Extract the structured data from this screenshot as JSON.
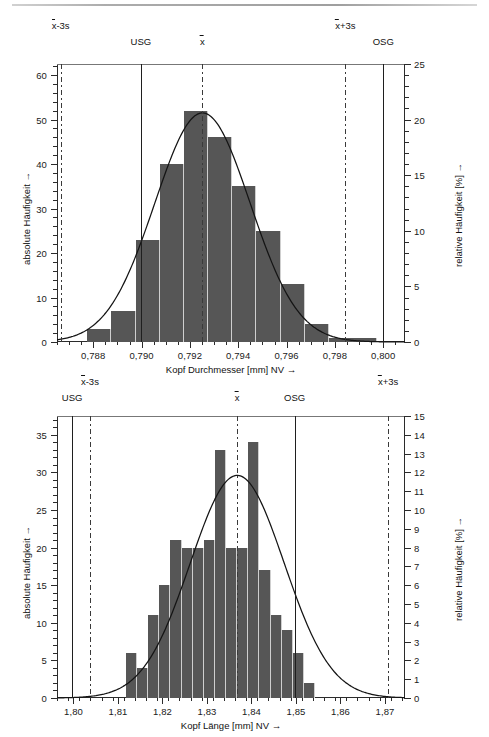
{
  "figures": [
    {
      "id": "kopf-durchmesser",
      "y_left_title": "absolute Häufigkeit →",
      "y_right_title": "relative Häufigkeit [%] →",
      "x_title": "Kopf Durchmesser [mm]  NV →",
      "markers": [
        {
          "name": "xbar-minus-3s",
          "label_pre": "x",
          "label_post": "-3s",
          "value": 0.78665,
          "style": "dashdot",
          "row": 0
        },
        {
          "name": "usg",
          "label_pre": "",
          "label_post": "USG",
          "value": 0.78997,
          "style": "solid",
          "row": 1
        },
        {
          "name": "xbar",
          "label_pre": "x",
          "label_post": "",
          "value": 0.79252,
          "style": "dashdot",
          "row": 1
        },
        {
          "name": "xbar-plus-3s",
          "label_pre": "x",
          "label_post": "+3s",
          "value": 0.79843,
          "style": "dashdot",
          "row": 0
        },
        {
          "name": "osg",
          "label_pre": "",
          "label_post": "OSG",
          "value": 0.8,
          "style": "solid",
          "row": 1
        }
      ],
      "chart_data": {
        "type": "bar",
        "title": "",
        "xlabel": "Kopf Durchmesser [mm]  NV →",
        "ylabel": "absolute Häufigkeit →",
        "y2label": "relative Häufigkeit [%] →",
        "xlim": [
          0.7865,
          0.8009
        ],
        "ylim": [
          0,
          62.5
        ],
        "y2lim": [
          0,
          25
        ],
        "grid": false,
        "legend": "none",
        "xticks": [
          "0,788",
          "0,790",
          "0,792",
          "0,794",
          "0,796",
          "0,798",
          "0,800"
        ],
        "xtick_values": [
          0.788,
          0.79,
          0.792,
          0.794,
          0.796,
          0.798,
          0.8
        ],
        "xtick_minor_step": 0.0005,
        "yticks": [
          0,
          10,
          20,
          30,
          40,
          50,
          60
        ],
        "ytick_minor_step": 2,
        "y2ticks": [
          0,
          5,
          10,
          15,
          20,
          25
        ],
        "y2tick_minor_step": 1,
        "bin_width": 0.0005,
        "bin_starts": [
          0.78725,
          0.78775,
          0.78825,
          0.78875,
          0.78925,
          0.78975,
          0.79025,
          0.79075,
          0.79125,
          0.79175,
          0.79225,
          0.79275,
          0.79325,
          0.79375,
          0.79425,
          0.79475,
          0.79525,
          0.79575,
          0.79625,
          0.79675,
          0.79725,
          0.79775,
          0.79825,
          0.79875,
          0.79925
        ],
        "values": [
          0,
          3,
          3,
          7,
          7,
          23,
          23,
          40,
          40,
          52,
          52,
          46,
          46,
          35,
          35,
          25,
          25,
          13,
          13,
          4,
          4,
          1,
          1,
          1,
          1
        ],
        "bars": [
          {
            "start": 0.78775,
            "end": 0.78875,
            "count": 3
          },
          {
            "start": 0.78875,
            "end": 0.78975,
            "count": 7
          },
          {
            "start": 0.78975,
            "end": 0.79075,
            "count": 23
          },
          {
            "start": 0.79075,
            "end": 0.79175,
            "count": 40
          },
          {
            "start": 0.79175,
            "end": 0.79275,
            "count": 52
          },
          {
            "start": 0.79275,
            "end": 0.79375,
            "count": 46
          },
          {
            "start": 0.79375,
            "end": 0.79475,
            "count": 35
          },
          {
            "start": 0.79475,
            "end": 0.79575,
            "count": 25
          },
          {
            "start": 0.79575,
            "end": 0.79675,
            "count": 13
          },
          {
            "start": 0.79675,
            "end": 0.79775,
            "count": 4
          },
          {
            "start": 0.79775,
            "end": 0.79975,
            "count": 1
          }
        ],
        "normal_curve": {
          "mean": 0.79252,
          "sigma": 0.001972,
          "peak": 51.5
        }
      }
    },
    {
      "id": "kopf-laenge",
      "y_left_title": "absolute Häufigkeit →",
      "y_right_title": "relative Häufigkeit [%] →",
      "x_title": "Kopf Länge [mm]  NV →",
      "markers": [
        {
          "name": "usg",
          "label_pre": "",
          "label_post": "USG",
          "value": 1.7997,
          "style": "solid",
          "row": 1
        },
        {
          "name": "xbar-minus-3s",
          "label_pre": "x",
          "label_post": "-3s",
          "value": 1.8037,
          "style": "dashdot",
          "row": 0
        },
        {
          "name": "xbar",
          "label_pre": "x",
          "label_post": "",
          "value": 1.8368,
          "style": "dashdot",
          "row": 1
        },
        {
          "name": "osg",
          "label_pre": "",
          "label_post": "OSG",
          "value": 1.8497,
          "style": "solid",
          "row": 1
        },
        {
          "name": "xbar-plus-3s",
          "label_pre": "x",
          "label_post": "+3s",
          "value": 1.8707,
          "style": "dashdot",
          "row": 0
        }
      ],
      "chart_data": {
        "type": "bar",
        "title": "",
        "xlabel": "Kopf Länge [mm]  NV →",
        "ylabel": "absolute Häufigkeit →",
        "y2label": "relative Häufigkeit [%] →",
        "xlim": [
          1.7963,
          1.8745
        ],
        "ylim": [
          0,
          37.5
        ],
        "y2lim": [
          0,
          15
        ],
        "grid": false,
        "legend": "none",
        "xticks": [
          "1,80",
          "1,81",
          "1,82",
          "1,83",
          "1,84",
          "1,85",
          "1,86",
          "1,87"
        ],
        "xtick_values": [
          1.8,
          1.81,
          1.82,
          1.83,
          1.84,
          1.85,
          1.86,
          1.87
        ],
        "xtick_minor_step": 0.0025,
        "yticks": [
          0,
          5,
          10,
          15,
          20,
          25,
          30,
          35
        ],
        "ytick_minor_step": 1,
        "y2ticks": [
          0,
          1,
          2,
          3,
          4,
          5,
          6,
          7,
          8,
          9,
          10,
          11,
          12,
          13,
          14,
          15
        ],
        "y2tick_minor_step": 1,
        "bin_width": 0.0025,
        "bars": [
          {
            "start": 1.8118,
            "end": 1.8143,
            "count": 6
          },
          {
            "start": 1.8143,
            "end": 1.8168,
            "count": 4
          },
          {
            "start": 1.8168,
            "end": 1.8193,
            "count": 11
          },
          {
            "start": 1.8193,
            "end": 1.8218,
            "count": 15
          },
          {
            "start": 1.8218,
            "end": 1.8243,
            "count": 21
          },
          {
            "start": 1.8243,
            "end": 1.8268,
            "count": 20
          },
          {
            "start": 1.8268,
            "end": 1.8293,
            "count": 20
          },
          {
            "start": 1.8293,
            "end": 1.8318,
            "count": 21
          },
          {
            "start": 1.8318,
            "end": 1.8343,
            "count": 33
          },
          {
            "start": 1.8343,
            "end": 1.8368,
            "count": 20
          },
          {
            "start": 1.8368,
            "end": 1.8393,
            "count": 20
          },
          {
            "start": 1.8393,
            "end": 1.8418,
            "count": 34
          },
          {
            "start": 1.8418,
            "end": 1.8443,
            "count": 17
          },
          {
            "start": 1.8443,
            "end": 1.8468,
            "count": 11
          },
          {
            "start": 1.8468,
            "end": 1.8493,
            "count": 9
          },
          {
            "start": 1.8493,
            "end": 1.8518,
            "count": 6
          },
          {
            "start": 1.8518,
            "end": 1.8543,
            "count": 2
          }
        ],
        "normal_curve": {
          "mean": 1.8368,
          "sigma": 0.01055,
          "peak": 29.6
        }
      }
    }
  ]
}
